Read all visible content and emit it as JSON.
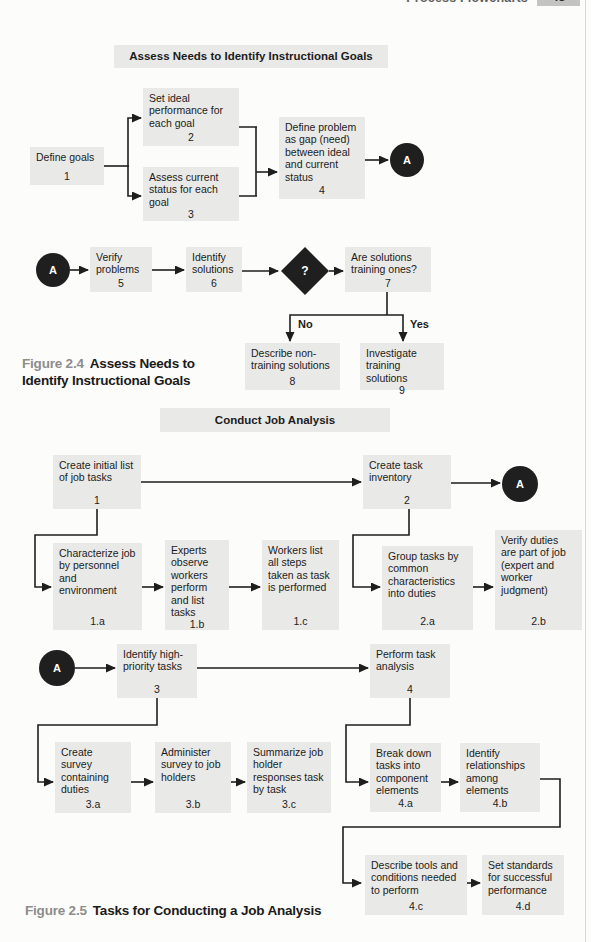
{
  "page": {
    "running_head": "Process Flowcharts",
    "page_number": "43"
  },
  "colors": {
    "box_bg": "#e9e9e7",
    "ink": "#1e1e1e",
    "badge_bg": "#c3c3c1",
    "caption_label": "#8d8d8b"
  },
  "fig24": {
    "title": "Assess Needs to Identify Instructional Goals",
    "caption": {
      "label": "Figure 2.4",
      "text": "Assess Needs to Identify Instructional Goals"
    },
    "connector_label": "A",
    "decision_label": "?",
    "branch_no": "No",
    "branch_yes": "Yes",
    "nodes": {
      "n1": {
        "text": "Define goals",
        "num": "1"
      },
      "n2": {
        "text": "Set ideal performance for each goal",
        "num": "2"
      },
      "n3": {
        "text": "Assess current status for each goal",
        "num": "3"
      },
      "n4": {
        "text": "Define problem as gap (need) between ideal and current status",
        "num": "4"
      },
      "n5": {
        "text": "Verify problems",
        "num": "5"
      },
      "n6": {
        "text": "Identify solutions",
        "num": "6"
      },
      "n7": {
        "text": "Are solutions training ones?",
        "num": "7"
      },
      "n8": {
        "text": "Describe non-training solutions",
        "num": "8"
      },
      "n9": {
        "text": "Investigate training solutions",
        "num": "9"
      }
    }
  },
  "fig25": {
    "title": "Conduct Job Analysis",
    "caption": {
      "label": "Figure 2.5",
      "text": "Tasks for Conducting a Job Analysis"
    },
    "connector_label": "A",
    "nodes": {
      "m1": {
        "text": "Create initial list of job tasks",
        "num": "1"
      },
      "m2": {
        "text": "Create task inventory",
        "num": "2"
      },
      "m1a": {
        "text": "Characterize job by personnel and environment",
        "num": "1.a"
      },
      "m1b": {
        "text": "Experts observe workers perform and list tasks",
        "num": "1.b"
      },
      "m1c": {
        "text": "Workers list all steps taken as task is performed",
        "num": "1.c"
      },
      "m2a": {
        "text": "Group tasks by common characteristics into duties",
        "num": "2.a"
      },
      "m2b": {
        "text": "Verify duties are part of job (expert and worker judgment)",
        "num": "2.b"
      },
      "m3": {
        "text": "Identify high-priority tasks",
        "num": "3"
      },
      "m4": {
        "text": "Perform task analysis",
        "num": "4"
      },
      "m3a": {
        "text": "Create survey containing duties",
        "num": "3.a"
      },
      "m3b": {
        "text": "Administer survey to job holders",
        "num": "3.b"
      },
      "m3c": {
        "text": "Summarize job holder responses task by task",
        "num": "3.c"
      },
      "m4a": {
        "text": "Break down tasks into component elements",
        "num": "4.a"
      },
      "m4b": {
        "text": "Identify relationships among elements",
        "num": "4.b"
      },
      "m4c": {
        "text": "Describe tools and conditions needed to perform",
        "num": "4.c"
      },
      "m4d": {
        "text": "Set standards for successful performance",
        "num": "4.d"
      }
    }
  }
}
